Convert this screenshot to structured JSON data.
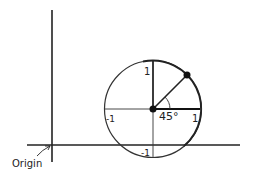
{
  "diagram": {
    "type": "unit-circle-offset",
    "labels": {
      "origin": "Origin",
      "top": "1",
      "left": "-1",
      "right": "1",
      "bottom": "-1",
      "angle": "45°"
    },
    "angle_degrees": 45,
    "colors": {
      "ink": "#222222",
      "background": "#ffffff"
    }
  }
}
